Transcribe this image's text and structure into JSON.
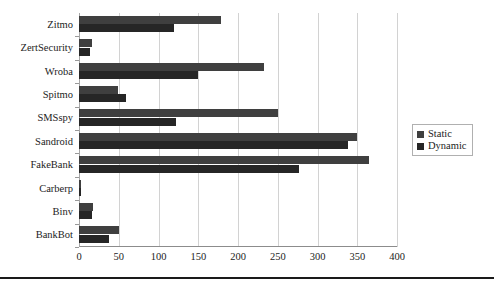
{
  "chart_data": {
    "type": "bar",
    "orientation": "horizontal",
    "title": "",
    "subtitle": "",
    "xlabel": "",
    "ylabel": "",
    "categories": [
      "BankBot",
      "Binv",
      "Carberp",
      "FakeBank",
      "Sandroid",
      "SMSspy",
      "Spitmo",
      "Wroba",
      "ZertSecurity",
      "Zitmo"
    ],
    "categories_top_to_bottom": [
      "Zitmo",
      "ZertSecurity",
      "Wroba",
      "Spitmo",
      "SMSspy",
      "Sandroid",
      "FakeBank",
      "Carberp",
      "Binv",
      "BankBot"
    ],
    "series": [
      {
        "name": "Static",
        "color": "#3f3f3f",
        "values": [
          50,
          18,
          3,
          365,
          350,
          250,
          49,
          233,
          16,
          178
        ]
      },
      {
        "name": "Dynamic",
        "color": "#262626",
        "values": [
          38,
          16,
          2,
          277,
          338,
          122,
          59,
          150,
          14,
          120
        ]
      }
    ],
    "xticks": [
      0,
      50,
      100,
      150,
      200,
      250,
      300,
      350,
      400
    ],
    "xlim": [
      0,
      400
    ],
    "grid": true,
    "legend_position": "right"
  },
  "legend": {
    "items": [
      {
        "label": "Static"
      },
      {
        "label": "Dynamic"
      }
    ]
  }
}
